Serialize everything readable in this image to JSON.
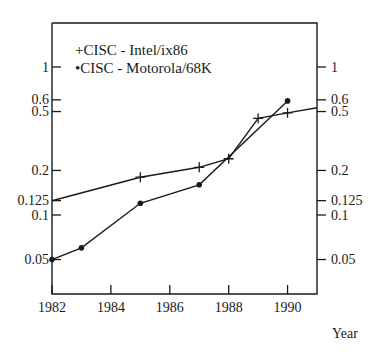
{
  "chart_data": {
    "type": "line",
    "title": "",
    "xlabel": "Year",
    "ylabel": "",
    "yscale": "log",
    "xlim": [
      1982,
      1991
    ],
    "ylim": [
      0.029,
      1.98
    ],
    "x_ticks": [
      1982,
      1984,
      1986,
      1988,
      1990
    ],
    "y_ticks": [
      1,
      0.6,
      0.5,
      0.2,
      0.125,
      0.1,
      0.05
    ],
    "y_tick_labels": [
      "1",
      "0.6",
      "0.5",
      "0.2",
      "0.125",
      "0.1",
      "0.05"
    ],
    "right_axis_mirrors_left": true,
    "grid": false,
    "legend_position": "upper left (inside plot)",
    "series": [
      {
        "name": "CISC - Intel/ix86",
        "marker": "+",
        "x": [
          1982,
          1985,
          1987,
          1988,
          1989,
          1990,
          1991
        ],
        "values": [
          0.125,
          0.18,
          0.21,
          0.24,
          0.45,
          0.49,
          0.53
        ],
        "marker_points": [
          false,
          true,
          true,
          true,
          true,
          true,
          false
        ]
      },
      {
        "name": "CISC - Motorola/68K",
        "marker": "•",
        "x": [
          1982,
          1983,
          1985,
          1987,
          1990
        ],
        "values": [
          0.05,
          0.06,
          0.12,
          0.16,
          0.59
        ],
        "marker_points": [
          true,
          true,
          true,
          true,
          true
        ]
      }
    ]
  },
  "legend": {
    "items": [
      {
        "symbol": "+",
        "label": "CISC - Intel/ix86"
      },
      {
        "symbol": "•",
        "label": "CISC - Motorola/68K"
      }
    ]
  },
  "axis": {
    "x_label": "Year"
  },
  "colors": {
    "ink": "#1a1a1a",
    "background": "#ffffff"
  }
}
